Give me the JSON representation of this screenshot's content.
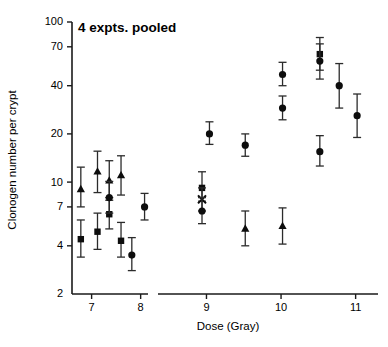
{
  "chart_data": {
    "type": "scatter",
    "title": "4 expts. pooled",
    "xlabel": "Dose (Gray)",
    "ylabel": "Clonogen number per crypt",
    "yscale": "log",
    "ylim": [
      2,
      100
    ],
    "ytick_labels": [
      "100",
      "70",
      "40",
      "20",
      "10",
      "7",
      "4",
      "2"
    ],
    "ytick_values": [
      100,
      70,
      40,
      20,
      10,
      7,
      4,
      2
    ],
    "xtick_labels": [
      "7",
      "8",
      "9",
      "10",
      "11"
    ],
    "xtick_values": [
      7,
      8,
      9,
      10,
      11
    ],
    "xlim": [
      6.6,
      11.3
    ],
    "axis_break": {
      "from": 8.15,
      "to": 8.35
    },
    "grid": false,
    "legend": "none",
    "series": [
      {
        "name": "triangle",
        "marker": "triangle",
        "points": [
          {
            "x": 6.78,
            "y": 9.0,
            "lo": 7.0,
            "hi": 12.4
          },
          {
            "x": 7.12,
            "y": 11.6,
            "lo": 8.6,
            "hi": 15.6
          },
          {
            "x": 7.36,
            "y": 10.2,
            "lo": 7.7,
            "hi": 13.6
          },
          {
            "x": 7.6,
            "y": 11.0,
            "lo": 8.3,
            "hi": 14.6
          },
          {
            "x": 9.52,
            "y": 5.1,
            "lo": 4.0,
            "hi": 6.6
          },
          {
            "x": 10.02,
            "y": 5.3,
            "lo": 4.1,
            "hi": 6.9
          }
        ]
      },
      {
        "name": "square",
        "marker": "square",
        "points": [
          {
            "x": 6.78,
            "y": 4.4,
            "lo": 3.4,
            "hi": 5.8
          },
          {
            "x": 7.12,
            "y": 4.9,
            "lo": 3.8,
            "hi": 6.4
          },
          {
            "x": 7.36,
            "y": 6.3,
            "lo": 5.1,
            "hi": 8.0
          },
          {
            "x": 7.6,
            "y": 4.3,
            "lo": 3.4,
            "hi": 5.6
          },
          {
            "x": 8.94,
            "y": 9.2,
            "lo": 7.6,
            "hi": 11.6
          },
          {
            "x": 10.52,
            "y": 63.0,
            "lo": 50.0,
            "hi": 80.0
          }
        ]
      },
      {
        "name": "circle",
        "marker": "circle",
        "points": [
          {
            "x": 7.36,
            "y": 8.0,
            "lo": 6.4,
            "hi": 10.1
          },
          {
            "x": 7.82,
            "y": 3.5,
            "lo": 2.8,
            "hi": 4.5
          },
          {
            "x": 8.08,
            "y": 7.0,
            "lo": 5.8,
            "hi": 8.5
          },
          {
            "x": 8.94,
            "y": 6.6,
            "lo": 5.5,
            "hi": 8.0
          },
          {
            "x": 9.04,
            "y": 20.0,
            "lo": 17.2,
            "hi": 23.8
          },
          {
            "x": 9.52,
            "y": 17.0,
            "lo": 14.5,
            "hi": 20.0
          },
          {
            "x": 10.02,
            "y": 47.0,
            "lo": 40.0,
            "hi": 56.0
          },
          {
            "x": 10.02,
            "y": 29.0,
            "lo": 24.5,
            "hi": 34.5
          },
          {
            "x": 10.52,
            "y": 57.0,
            "lo": 44.0,
            "hi": 73.0
          },
          {
            "x": 10.52,
            "y": 15.5,
            "lo": 12.6,
            "hi": 19.5
          },
          {
            "x": 10.78,
            "y": 40.0,
            "lo": 29.0,
            "hi": 55.0
          },
          {
            "x": 11.02,
            "y": 26.0,
            "lo": 19.0,
            "hi": 35.5
          }
        ]
      },
      {
        "name": "cross",
        "marker": "cross",
        "points": [
          {
            "x": 8.94,
            "y": 7.8,
            "lo": 6.6,
            "hi": 9.2
          }
        ]
      }
    ]
  }
}
